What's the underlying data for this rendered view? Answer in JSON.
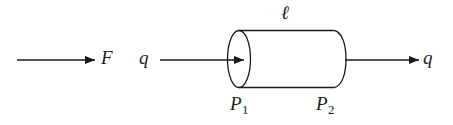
{
  "figure": {
    "caption": "",
    "stroke_color": "#1a1a1a",
    "background_color": "#ffffff",
    "width": 453,
    "height": 125
  },
  "labels": {
    "force": "F",
    "flow_in": "q",
    "flow_out": "q",
    "length": "ℓ",
    "pressure_1_base": "P",
    "pressure_1_sub": "1",
    "pressure_2_base": "P",
    "pressure_2_sub": "2"
  },
  "diagram": {
    "type": "pipe-flow-schematic",
    "elements": [
      {
        "name": "force-arrow",
        "kind": "arrow",
        "x1": 17,
        "y1": 60,
        "x2": 95,
        "y2": 60,
        "label": "F"
      },
      {
        "name": "inlet-flow-arrow",
        "kind": "arrow",
        "x1": 160,
        "y1": 60,
        "x2": 244,
        "y2": 60,
        "label": "q"
      },
      {
        "name": "outlet-flow-arrow",
        "kind": "arrow",
        "x1": 345,
        "y1": 60,
        "x2": 419,
        "y2": 60,
        "label": "q"
      },
      {
        "name": "pipe-left-face",
        "kind": "ellipse",
        "cx": 239,
        "cy": 59,
        "rx": 11.5,
        "ry": 28.5
      },
      {
        "name": "pipe-body-top",
        "kind": "line",
        "x1": 239,
        "y1": 30.5,
        "x2": 334,
        "y2": 30.5
      },
      {
        "name": "pipe-body-bottom",
        "kind": "line",
        "x1": 239,
        "y1": 87.5,
        "x2": 334,
        "y2": 87.5
      },
      {
        "name": "pipe-right-cap",
        "kind": "arc",
        "x1": 334,
        "y1": 30.5,
        "x2": 334,
        "y2": 87.5,
        "bulge": 11.5
      }
    ]
  }
}
